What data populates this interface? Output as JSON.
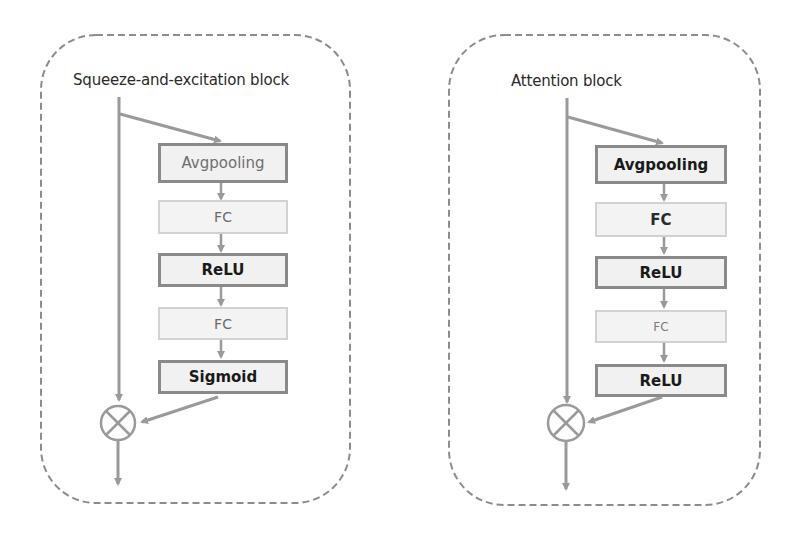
{
  "colors": {
    "panel_border": "#8c8c8c",
    "wire": "#9a9a9a",
    "strong_box_border": "#8a8a8a",
    "light_box_border": "#d2d2d2",
    "box_fill": "#f1f1f1",
    "text_dark": "#1a1a1a"
  },
  "panels": [
    {
      "title": "Squeeze-and-excitation block",
      "nodes": [
        {
          "label": "Avgpooling",
          "style": "strong"
        },
        {
          "label": "FC",
          "style": "light"
        },
        {
          "label": "ReLU",
          "style": "strong"
        },
        {
          "label": "FC",
          "style": "light"
        },
        {
          "label": "Sigmoid",
          "style": "strong"
        }
      ],
      "merge_op": "multiply (⊗)"
    },
    {
      "title": "Attention block",
      "nodes": [
        {
          "label": "Avgpooling",
          "style": "strong"
        },
        {
          "label": "FC",
          "style": "light"
        },
        {
          "label": "ReLU",
          "style": "strong"
        },
        {
          "label": "FC",
          "style": "light"
        },
        {
          "label": "ReLU",
          "style": "strong"
        }
      ],
      "merge_op": "multiply (⊗)"
    }
  ]
}
